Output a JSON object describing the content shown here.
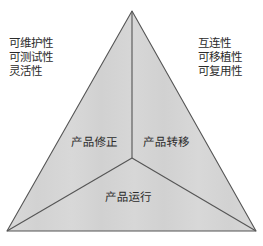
{
  "diagram": {
    "type": "triangle-partition",
    "background_color": "#ffffff",
    "fill_color": "#d5d5d5",
    "stroke_color": "#555555",
    "text_color": "#2b2b2b",
    "apex": {
      "x": 132,
      "y": 11
    },
    "bottom_left": {
      "x": 7,
      "y": 231
    },
    "bottom_right": {
      "x": 256,
      "y": 231
    },
    "center": {
      "x": 132,
      "y": 158
    }
  },
  "attributes_left": {
    "lines": [
      "可维护性",
      "可测试性",
      "灵活性"
    ]
  },
  "attributes_right": {
    "lines": [
      "互连性",
      "可移植性",
      "可复用性"
    ]
  },
  "regions": {
    "repair": "产品修正",
    "transfer": "产品转移",
    "operate": "产品运行"
  }
}
